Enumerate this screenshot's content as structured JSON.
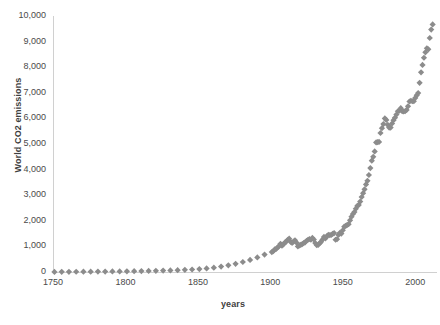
{
  "chart_data": {
    "type": "scatter",
    "title": "",
    "xlabel": "years",
    "ylabel": "World CO2 emissions",
    "xlim": [
      1750,
      2015
    ],
    "ylim": [
      0,
      10000
    ],
    "grid": false,
    "legend": null,
    "marker": {
      "shape": "diamond",
      "color": "#8c8c8c",
      "size": 4
    },
    "xticks": [
      1750,
      1800,
      1850,
      1900,
      1950,
      2000
    ],
    "xtick_labels": [
      "1750",
      "1800",
      "1850",
      "1900",
      "1950",
      "2000"
    ],
    "yticks": [
      0,
      1000,
      2000,
      3000,
      4000,
      5000,
      6000,
      7000,
      8000,
      9000,
      10000
    ],
    "ytick_labels": [
      "0",
      "1,000",
      "2,000",
      "3,000",
      "4,000",
      "5,000",
      "6,000",
      "7,000",
      "8,000",
      "9,000",
      "10,000"
    ],
    "series": [
      {
        "name": "World CO2 emissions",
        "x": [
          1751,
          1756,
          1761,
          1766,
          1771,
          1776,
          1781,
          1786,
          1791,
          1796,
          1801,
          1806,
          1811,
          1816,
          1821,
          1826,
          1831,
          1836,
          1841,
          1846,
          1851,
          1856,
          1861,
          1866,
          1871,
          1876,
          1881,
          1886,
          1891,
          1896,
          1901,
          1902,
          1903,
          1904,
          1905,
          1906,
          1907,
          1908,
          1909,
          1910,
          1911,
          1912,
          1913,
          1914,
          1915,
          1916,
          1917,
          1918,
          1919,
          1920,
          1921,
          1922,
          1923,
          1924,
          1925,
          1926,
          1927,
          1928,
          1929,
          1930,
          1931,
          1932,
          1933,
          1934,
          1935,
          1936,
          1937,
          1938,
          1939,
          1940,
          1941,
          1942,
          1943,
          1944,
          1945,
          1946,
          1947,
          1948,
          1949,
          1950,
          1951,
          1952,
          1953,
          1954,
          1955,
          1956,
          1957,
          1958,
          1959,
          1960,
          1961,
          1962,
          1963,
          1964,
          1965,
          1966,
          1967,
          1968,
          1969,
          1970,
          1971,
          1972,
          1973,
          1974,
          1975,
          1976,
          1977,
          1978,
          1979,
          1980,
          1981,
          1982,
          1983,
          1984,
          1985,
          1986,
          1987,
          1988,
          1989,
          1990,
          1991,
          1992,
          1993,
          1994,
          1995,
          1996,
          1997,
          1998,
          1999,
          2000,
          2001,
          2002,
          2003,
          2004,
          2005,
          2006,
          2007,
          2008,
          2009,
          2010,
          2011,
          2012
        ],
        "y": [
          3,
          5,
          7,
          9,
          11,
          14,
          16,
          18,
          21,
          24,
          28,
          32,
          36,
          41,
          47,
          54,
          62,
          72,
          84,
          98,
          116,
          140,
          170,
          210,
          260,
          320,
          390,
          470,
          570,
          680,
          780,
          810,
          880,
          900,
          960,
          1010,
          1100,
          1030,
          1080,
          1150,
          1190,
          1260,
          1300,
          1180,
          1140,
          1190,
          1240,
          1150,
          1000,
          1040,
          1060,
          1090,
          1130,
          1160,
          1220,
          1260,
          1290,
          1260,
          1330,
          1270,
          1130,
          1050,
          1060,
          1120,
          1180,
          1270,
          1370,
          1310,
          1400,
          1450,
          1440,
          1450,
          1490,
          1520,
          1260,
          1280,
          1450,
          1530,
          1500,
          1630,
          1770,
          1800,
          1840,
          1870,
          2020,
          2160,
          2270,
          2340,
          2470,
          2580,
          2620,
          2750,
          2930,
          3080,
          3230,
          3420,
          3560,
          3790,
          4060,
          4350,
          4500,
          4710,
          5060,
          5070,
          5080,
          5430,
          5620,
          5780,
          6000,
          5940,
          5750,
          5640,
          5640,
          5800,
          5930,
          6030,
          6150,
          6280,
          6300,
          6400,
          6280,
          6270,
          6280,
          6330,
          6470,
          6660,
          6690,
          6670,
          6670,
          6800,
          6900,
          6990,
          7390,
          7800,
          8090,
          8370,
          8580,
          8740,
          8700,
          9140,
          9470,
          9670
        ]
      }
    ]
  },
  "axis": {
    "y_title": "World CO2 emissions",
    "x_title": "years"
  },
  "bottom_caption": ""
}
